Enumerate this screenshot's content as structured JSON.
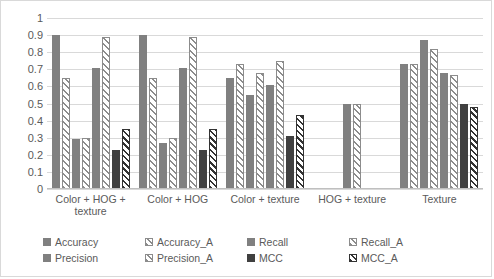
{
  "chart_data": {
    "type": "bar",
    "title": "",
    "xlabel": "",
    "ylabel": "",
    "ylim": [
      0,
      1
    ],
    "ytick_labels": [
      "1",
      "0.9",
      "0.8",
      "0.7",
      "0.6",
      "0.5",
      "0.4",
      "0.3",
      "0.2",
      "0.1",
      "0"
    ],
    "ytick_values": [
      1,
      0.9,
      0.8,
      0.7,
      0.6,
      0.5,
      0.4,
      0.3,
      0.2,
      0.1,
      0
    ],
    "grid": true,
    "legend_position": "bottom",
    "categories": [
      "Color + HOG + texture",
      "Color + HOG",
      "Color + texture",
      "HOG + texture",
      "Texture"
    ],
    "series": [
      {
        "name": "Accuracy",
        "style": "solid-light",
        "values": [
          0.9,
          0.9,
          0.65,
          0.5,
          0.73
        ]
      },
      {
        "name": "Accuracy_A",
        "style": "hatch-light",
        "values": [
          0.65,
          0.65,
          0.73,
          0.5,
          0.73
        ]
      },
      {
        "name": "Recall",
        "style": "solid-light",
        "values": [
          0.29,
          0.27,
          0.55,
          null,
          0.87
        ]
      },
      {
        "name": "Recall_A",
        "style": "hatch-light",
        "values": [
          0.3,
          0.3,
          0.68,
          null,
          0.82
        ]
      },
      {
        "name": "Precision",
        "style": "solid-light",
        "values": [
          0.71,
          0.71,
          0.61,
          null,
          0.68
        ]
      },
      {
        "name": "Precision_A",
        "style": "hatch-light",
        "values": [
          0.89,
          0.89,
          0.75,
          null,
          0.665
        ]
      },
      {
        "name": "MCC",
        "style": "solid-dark",
        "values": [
          0.23,
          0.23,
          0.31,
          null,
          0.5
        ]
      },
      {
        "name": "MCC_A",
        "style": "hatch-dark",
        "values": [
          0.35,
          0.35,
          0.43,
          null,
          0.48
        ]
      }
    ]
  },
  "legend": {
    "items": [
      {
        "label": "Accuracy",
        "style": "solid-light"
      },
      {
        "label": "Accuracy_A",
        "style": "hatch-light"
      },
      {
        "label": "Recall",
        "style": "solid-light"
      },
      {
        "label": "Recall_A",
        "style": "hatch-light"
      },
      {
        "label": "Precision",
        "style": "solid-light"
      },
      {
        "label": "Precision_A",
        "style": "hatch-light"
      },
      {
        "label": "MCC",
        "style": "solid-dark"
      },
      {
        "label": "MCC_A",
        "style": "hatch-dark"
      }
    ]
  },
  "colors": {
    "solid_light": "#808080",
    "solid_dark": "#404040",
    "hatch_light_line": "#8c8c8c",
    "hatch_dark_line": "#333333",
    "gridline": "#d9d9d9",
    "text": "#5a5a5a",
    "border": "#d9d9d9"
  }
}
